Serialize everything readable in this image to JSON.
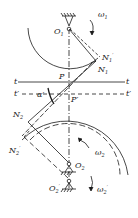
{
  "diagram": {
    "title": "",
    "labels": {
      "O1": "O",
      "O1_sub": "1",
      "omega1": "ω",
      "omega1_sub": "1",
      "N1_prime": "N",
      "N1_prime_sub": "1",
      "N1_prime_mark": "′",
      "N1": "N",
      "N1_sub": "1",
      "P": "P",
      "P_prime": "P′",
      "t_left": "t",
      "t_right": "t",
      "t_prime_left": "t′",
      "t_prime_right": "t′",
      "alpha_prime": "α′",
      "N2": "N",
      "N2_sub": "2",
      "N2_prime": "N",
      "N2_prime_sub": "2",
      "N2_prime_mark": "′",
      "O2": "O",
      "O2_sub": "2",
      "omega2": "ω",
      "omega2_sub": "2",
      "O2_prime": "O",
      "O2_prime_sub": "2",
      "O2_prime_mark": "′",
      "omega2_prime": "ω",
      "omega2_prime_sub": "2",
      "omega2_prime_mark": "′"
    },
    "colors": {
      "line": "#1a1a1a",
      "background": "#ffffff"
    }
  }
}
